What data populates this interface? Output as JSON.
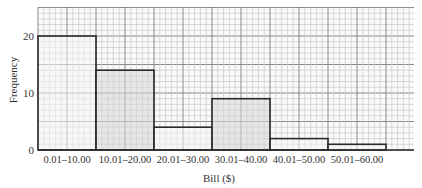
{
  "chart_data": {
    "type": "bar",
    "title": "",
    "xlabel": "Bill ($)",
    "ylabel": "Frequency",
    "categories": [
      "0.01–10.00",
      "10.01–20.00",
      "20.01–30.00",
      "30.01–40.00",
      "40.01–50.00",
      "50.01–60.00"
    ],
    "values": [
      20,
      14,
      4,
      9,
      2,
      1
    ],
    "ylim": [
      0,
      25
    ],
    "yticks": [
      0,
      10,
      20
    ],
    "grid": true,
    "legend": null,
    "bar_fills": [
      "#f4f4f4",
      "#d6d6d6",
      "#f4f4f4",
      "#d6d6d6",
      "#f4f4f4",
      "#f4f4f4"
    ],
    "histogram": true
  },
  "colors": {
    "grid_minor": "#c8c8c8",
    "grid_major": "#8a8a8a",
    "bar_edge": "#2a2a2a",
    "shaded": "#d6d6d6"
  }
}
